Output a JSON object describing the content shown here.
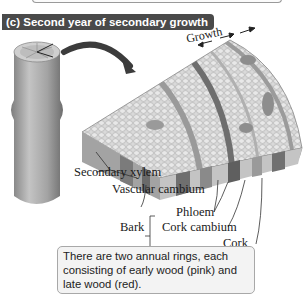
{
  "figure": {
    "panel_title": "(c) Second year of secondary growth",
    "growth_label": "Growth",
    "labels": {
      "secondary_xylem": "Secondary xylem",
      "vascular_cambium": "Vascular cambium",
      "phloem": "Phloem",
      "bark": "Bark",
      "cork_cambium": "Cork cambium",
      "cork": "Cork"
    },
    "caption": "There are two annual rings, each consisting of early wood (pink) and late wood (red)."
  },
  "colors": {
    "title_bg": "#4a4a4a",
    "caption_bg": "#f3f3f3",
    "stem": "#9c9c9c",
    "wood_light": "#d8d8d8",
    "wood_dark": "#6e6e6e"
  }
}
